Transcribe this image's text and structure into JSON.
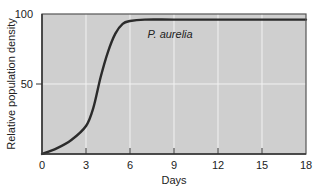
{
  "chart_data": {
    "type": "line",
    "title": "",
    "xlabel": "Days",
    "ylabel": "Relative population density",
    "xlim": [
      0,
      18
    ],
    "ylim": [
      0,
      100
    ],
    "xticks": [
      0,
      3,
      6,
      9,
      12,
      15,
      18
    ],
    "yticks": [
      50,
      100
    ],
    "grid": true,
    "series": [
      {
        "name": "P. aurelia",
        "x": [
          0,
          1,
          2,
          3,
          3.5,
          4,
          4.5,
          5,
          5.5,
          6,
          7,
          9,
          12,
          15,
          18
        ],
        "values": [
          0,
          4,
          10,
          20,
          33,
          55,
          73,
          86,
          93,
          95,
          96,
          96,
          96,
          96,
          96
        ]
      }
    ],
    "annotations": [
      {
        "text": "P. aurelia",
        "x": 7.2,
        "y": 83
      }
    ],
    "colors": {
      "plot_background": "#cfcfcf",
      "gridline": "#f2f2f2",
      "curve": "#2b2b2b",
      "frame": "#555555"
    }
  }
}
